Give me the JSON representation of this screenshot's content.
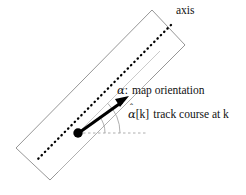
{
  "figure": {
    "name": "map-axis-track-course-diagram",
    "type": "technical-line-diagram",
    "background_color": "#ffffff",
    "width": 246,
    "height": 195
  },
  "labels": {
    "axis": "axis",
    "map_orientation_symbol": "α",
    "map_orientation_colon": ":",
    "map_orientation_text": "map orientation",
    "track_course_symbol": "α",
    "track_course_hat": "ˆ",
    "track_course_index": "[k]",
    "track_course_text": "track course at k"
  },
  "graphics": {
    "rectangle": {
      "name": "map-strip-rectangle",
      "stroke": "#8a8a8a",
      "stroke_width": 0.9,
      "fill": "none",
      "points": "152,10 185,45 50,180 16,148"
    },
    "dotted_axis_line": {
      "name": "dotted-axis-line",
      "stroke": "#000000",
      "stroke_width": 2.2,
      "dash": "0.5 4.2",
      "x1": 171,
      "y1": 25,
      "x2": 36,
      "y2": 161
    },
    "faint_parallel_line": {
      "name": "faint-parallel-reference-line",
      "stroke": "#bdbdbd",
      "stroke_width": 0.9,
      "x1": 78,
      "y1": 133,
      "x2": 158,
      "y2": 53
    },
    "lower_parallel_line": {
      "name": "lower-parallel-edge-line",
      "stroke": "#9a9a9a",
      "stroke_width": 0.9,
      "x1": 58,
      "y1": 172,
      "x2": 150,
      "y2": 80
    },
    "dashed_horizontal_line": {
      "name": "horizontal-reference-dashed-line",
      "stroke": "#8a8a8a",
      "stroke_width": 0.8,
      "dash": "2.5 2.5",
      "x1": 78,
      "y1": 133,
      "x2": 146,
      "y2": 133
    },
    "track_arrow": {
      "name": "track-course-arrow",
      "stroke": "#000000",
      "stroke_width": 3.2,
      "x1": 80,
      "y1": 132,
      "x2": 127,
      "y2": 98,
      "arrowhead_color": "#000000"
    },
    "origin_dot": {
      "name": "origin-dot",
      "cx": 78,
      "cy": 133,
      "r": 4.6,
      "fill": "#000000"
    },
    "angle_arc_alpha": {
      "name": "map-orientation-angle-arc",
      "stroke": "#8a8a8a",
      "stroke_width": 0.8,
      "radius": 40,
      "description": "arc from horizontal to faint parallel axis direction"
    },
    "angle_arc_alpha_hat": {
      "name": "track-course-angle-arc",
      "stroke": "#8a8a8a",
      "stroke_width": 0.8,
      "radius": 26,
      "description": "arc from horizontal to track arrow direction"
    }
  }
}
